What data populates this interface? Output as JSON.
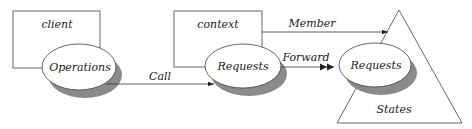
{
  "diagram": {
    "client_box": {
      "label": "client"
    },
    "context_box": {
      "label": "context"
    },
    "operations": {
      "label": "Operations"
    },
    "requests_context": {
      "label": "Requests"
    },
    "requests_states": {
      "label": "Requests"
    },
    "states_triangle": {
      "label": "States"
    },
    "edges": {
      "call": {
        "label": "Call"
      },
      "forward": {
        "label": "Forward"
      },
      "member": {
        "label": "Member"
      }
    },
    "colors": {
      "stroke": "#333333",
      "shadow": "#8a8a8a",
      "fill": "#ffffff"
    }
  }
}
